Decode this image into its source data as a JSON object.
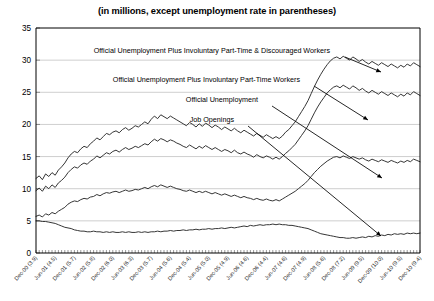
{
  "chart_data": {
    "type": "line",
    "title": "(in millions, except unemployment rate in parentheses)",
    "subtitle": "",
    "xlabel": "",
    "ylabel": "",
    "ylim": [
      0,
      35
    ],
    "y_ticks": [
      0,
      5,
      10,
      15,
      20,
      25,
      30,
      35
    ],
    "grid": true,
    "legend_position": "inline-annotations",
    "x_major_labels": [
      "Dec-00 (3.9)",
      "Jun-01 (4.5)",
      "Dec-01 (5.7)",
      "Jun-02 (5.8)",
      "Dec-02 (6.0)",
      "Jun-03 (6.3)",
      "Dec-03 (5.7)",
      "Jun-04 (5.6)",
      "Dec-04 (5.4)",
      "Jun-05 (5.0)",
      "Dec-05 (4.9)",
      "Jun-06 (4.6)",
      "Dec-06 (4.4)",
      "Jun-07 (4.6)",
      "Dec-07 (4.9)",
      "Jun-08 (5.6)",
      "Dec-08 (7.2)",
      "Jun-09 (9.5)",
      "Dec-09 (10.0)",
      "Jun-10 (9.5)",
      "Dec-10 (9.4)"
    ],
    "x_start": "Dec-00",
    "x_end": "Dec-10",
    "annotations": [
      {
        "name": "u6-plus-discouraged",
        "text": "Official Unemployment Plus Involuntary Part-Time & Discouraged Workers"
      },
      {
        "name": "u6-part-time",
        "text": "Official Unemployment Plus Involuntary Part-Time Workers"
      },
      {
        "name": "official-unemployment",
        "text": "Official Unemployment"
      },
      {
        "name": "job-openings",
        "text": "Job Openings"
      }
    ],
    "series": [
      {
        "name": "Official Unemployment Plus Involuntary Part-Time & Discouraged Workers",
        "values": [
          11.6,
          12.0,
          11.4,
          12.3,
          11.9,
          12.5,
          12.1,
          12.9,
          13.4,
          14.0,
          14.8,
          15.4,
          15.8,
          15.6,
          16.2,
          16.6,
          16.4,
          17.0,
          17.4,
          17.9,
          17.6,
          18.1,
          18.6,
          18.4,
          18.8,
          19.0,
          18.7,
          19.2,
          19.5,
          19.1,
          19.4,
          19.8,
          19.6,
          20.0,
          20.4,
          20.1,
          20.8,
          21.3,
          20.9,
          21.5,
          21.2,
          20.9,
          21.3,
          21.0,
          20.7,
          20.4,
          20.1,
          19.8,
          20.3,
          20.0,
          19.6,
          20.1,
          19.7,
          20.2,
          19.9,
          19.5,
          19.9,
          19.6,
          19.2,
          19.6,
          19.3,
          19.0,
          19.4,
          19.0,
          18.7,
          19.1,
          18.8,
          18.5,
          18.2,
          18.6,
          18.3,
          18.0,
          18.4,
          18.1,
          17.8,
          18.1,
          17.8,
          18.2,
          18.8,
          19.2,
          19.8,
          20.4,
          21.2,
          22.0,
          22.8,
          23.7,
          24.8,
          25.9,
          26.9,
          27.8,
          28.6,
          29.3,
          29.9,
          30.3,
          30.5,
          30.2,
          30.6,
          30.3,
          30.0,
          30.5,
          30.2,
          29.8,
          30.1,
          29.7,
          29.4,
          29.8,
          29.5,
          29.2,
          29.6,
          29.3,
          29.0,
          29.4,
          29.1,
          28.8,
          29.2,
          28.9,
          29.4,
          29.1,
          29.6,
          29.3,
          29.0
        ]
      },
      {
        "name": "Official Unemployment Plus Involuntary Part-Time Workers",
        "values": [
          9.7,
          10.1,
          9.6,
          10.4,
          10.0,
          10.6,
          10.2,
          10.9,
          11.3,
          11.8,
          12.5,
          13.0,
          13.4,
          13.2,
          13.7,
          14.0,
          13.8,
          14.3,
          14.6,
          15.1,
          14.8,
          15.2,
          15.6,
          15.4,
          15.8,
          16.0,
          15.7,
          16.1,
          16.4,
          16.1,
          16.3,
          16.6,
          16.4,
          16.7,
          17.0,
          16.8,
          17.3,
          17.7,
          17.4,
          17.8,
          17.6,
          17.3,
          17.6,
          17.4,
          17.1,
          16.9,
          16.6,
          16.4,
          16.8,
          16.5,
          16.2,
          16.6,
          16.3,
          16.7,
          16.4,
          16.1,
          16.4,
          16.1,
          15.8,
          16.1,
          15.9,
          15.6,
          16.0,
          15.6,
          15.4,
          15.7,
          15.4,
          15.2,
          14.9,
          15.3,
          15.0,
          14.8,
          15.1,
          14.9,
          14.6,
          14.9,
          14.6,
          15.0,
          15.5,
          15.9,
          16.4,
          16.9,
          17.6,
          18.3,
          19.0,
          19.8,
          20.8,
          21.8,
          22.7,
          23.5,
          24.2,
          24.9,
          25.4,
          25.8,
          26.0,
          25.7,
          26.1,
          25.8,
          25.5,
          26.0,
          25.7,
          25.3,
          25.6,
          25.2,
          24.9,
          25.3,
          25.0,
          24.7,
          25.1,
          24.8,
          24.5,
          24.9,
          24.6,
          24.3,
          24.7,
          24.4,
          24.9,
          24.6,
          25.1,
          24.8,
          24.5
        ]
      },
      {
        "name": "Official Unemployment",
        "values": [
          5.7,
          5.9,
          5.6,
          6.1,
          5.9,
          6.3,
          6.1,
          6.5,
          6.8,
          7.1,
          7.6,
          7.9,
          8.1,
          8.0,
          8.3,
          8.5,
          8.4,
          8.7,
          8.8,
          9.1,
          8.9,
          9.2,
          9.4,
          9.3,
          9.5,
          9.6,
          9.4,
          9.6,
          9.8,
          9.6,
          9.7,
          9.9,
          9.8,
          10.0,
          10.2,
          10.0,
          10.3,
          10.5,
          10.3,
          10.6,
          10.4,
          10.2,
          10.4,
          10.2,
          10.0,
          9.9,
          9.7,
          9.6,
          9.8,
          9.6,
          9.4,
          9.6,
          9.4,
          9.6,
          9.4,
          9.2,
          9.4,
          9.2,
          9.0,
          9.2,
          9.0,
          8.8,
          9.0,
          8.8,
          8.6,
          8.8,
          8.6,
          8.5,
          8.3,
          8.5,
          8.3,
          8.2,
          8.4,
          8.2,
          8.1,
          8.3,
          8.1,
          8.4,
          8.7,
          9.0,
          9.3,
          9.6,
          10.0,
          10.4,
          10.8,
          11.3,
          11.9,
          12.5,
          13.0,
          13.5,
          13.9,
          14.3,
          14.6,
          14.9,
          15.0,
          14.8,
          15.1,
          14.9,
          14.7,
          15.0,
          14.8,
          14.6,
          14.8,
          14.5,
          14.3,
          14.6,
          14.4,
          14.2,
          14.5,
          14.3,
          14.1,
          14.4,
          14.2,
          14.0,
          14.3,
          14.1,
          14.4,
          14.2,
          14.6,
          14.4,
          14.2
        ]
      },
      {
        "name": "Job Openings",
        "values": [
          5.0,
          5.0,
          4.9,
          4.9,
          4.8,
          4.7,
          4.6,
          4.4,
          4.2,
          4.0,
          3.9,
          3.8,
          3.6,
          3.5,
          3.4,
          3.4,
          3.3,
          3.3,
          3.4,
          3.3,
          3.3,
          3.2,
          3.3,
          3.2,
          3.3,
          3.2,
          3.2,
          3.3,
          3.2,
          3.3,
          3.2,
          3.2,
          3.3,
          3.2,
          3.3,
          3.2,
          3.3,
          3.3,
          3.4,
          3.3,
          3.4,
          3.4,
          3.5,
          3.4,
          3.5,
          3.5,
          3.6,
          3.5,
          3.6,
          3.6,
          3.7,
          3.6,
          3.7,
          3.7,
          3.8,
          3.7,
          3.8,
          3.8,
          3.9,
          3.8,
          3.9,
          4.0,
          3.9,
          4.0,
          4.1,
          4.2,
          4.1,
          4.3,
          4.2,
          4.3,
          4.4,
          4.3,
          4.4,
          4.4,
          4.5,
          4.4,
          4.5,
          4.4,
          4.4,
          4.3,
          4.3,
          4.2,
          4.1,
          4.0,
          3.9,
          3.8,
          3.6,
          3.4,
          3.2,
          3.0,
          2.9,
          2.8,
          2.7,
          2.6,
          2.5,
          2.4,
          2.4,
          2.3,
          2.3,
          2.4,
          2.3,
          2.4,
          2.5,
          2.4,
          2.6,
          2.5,
          2.7,
          2.6,
          2.8,
          2.7,
          2.9,
          2.8,
          3.0,
          2.9,
          3.0,
          2.9,
          3.1,
          3.0,
          3.1,
          3.0,
          3.1
        ]
      }
    ]
  }
}
